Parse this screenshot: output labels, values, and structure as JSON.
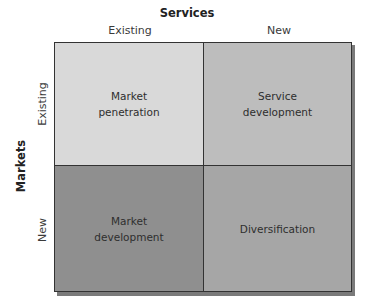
{
  "diagram": {
    "type": "2x2 matrix (Ansoff-style)",
    "x_axis": {
      "title": "Services",
      "columns": [
        "Existing",
        "New"
      ]
    },
    "y_axis": {
      "title": "Markets",
      "rows": [
        "Existing",
        "New"
      ]
    },
    "cells": {
      "existing_existing": {
        "line1": "Market",
        "line2": "penetration",
        "color": "#d9d9d9"
      },
      "existing_new": {
        "line1": "Service",
        "line2": "development",
        "color": "#bdbdbd"
      },
      "new_existing": {
        "line1": "Market",
        "line2": "development",
        "color": "#8f8f8f"
      },
      "new_new": {
        "line1": "Diversification",
        "line2": "",
        "color": "#a6a6a6"
      }
    }
  }
}
